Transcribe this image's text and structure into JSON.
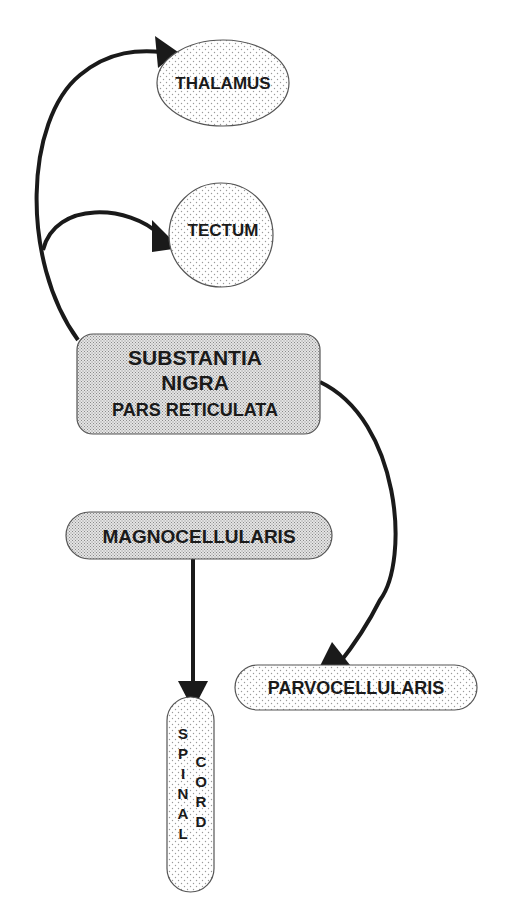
{
  "diagram": {
    "nodes": {
      "thalamus": {
        "label": "THALAMUS",
        "shape": "ellipse",
        "fill": "light-dotted"
      },
      "tectum": {
        "label": "TECTUM",
        "shape": "circle",
        "fill": "light-dotted"
      },
      "substantia_nigra": {
        "line1": "SUBSTANTIA",
        "line2": "NIGRA",
        "line3": "PARS RETICULATA",
        "shape": "rounded-rect",
        "fill": "dense-dotted"
      },
      "magnocellularis": {
        "label": "MAGNOCELLULARIS",
        "shape": "pill",
        "fill": "dense-dotted"
      },
      "parvocellularis": {
        "label": "PARVOCELLULARIS",
        "shape": "pill",
        "fill": "light-dotted"
      },
      "spinal_cord": {
        "col1": [
          "S",
          "P",
          "I",
          "N",
          "A",
          "L"
        ],
        "col2": [
          "C",
          "O",
          "R",
          "D"
        ],
        "shape": "vertical-pill",
        "fill": "light-dotted"
      }
    },
    "edges": [
      {
        "from": "SUBSTANTIA NIGRA PARS RETICULATA",
        "to": "THALAMUS"
      },
      {
        "from": "SUBSTANTIA NIGRA PARS RETICULATA",
        "to": "TECTUM"
      },
      {
        "from": "SUBSTANTIA NIGRA PARS RETICULATA",
        "to": "PARVOCELLULARIS"
      },
      {
        "from": "MAGNOCELLULARIS",
        "to": "SPINAL CORD"
      }
    ],
    "colors": {
      "ink": "#1a1a1a",
      "background": "#ffffff",
      "light_fill": "#f2f2f2",
      "dense_fill": "#d9d9d9"
    }
  }
}
